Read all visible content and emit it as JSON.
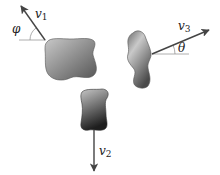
{
  "diagram": {
    "colors": {
      "background": "#ffffff",
      "fragment_light": "#bdbdbd",
      "fragment_dark": "#3a3a3a",
      "arrow": "#444444",
      "reference_line": "#9a9a9a"
    },
    "fragments": [
      {
        "id": "fragment-1",
        "velocity_label": "v",
        "velocity_subscript": "1",
        "angle_label": "φ",
        "direction": "up-left, angle φ above horizontal (left)"
      },
      {
        "id": "fragment-2",
        "velocity_label": "v",
        "velocity_subscript": "2",
        "direction": "straight down"
      },
      {
        "id": "fragment-3",
        "velocity_label": "v",
        "velocity_subscript": "3",
        "angle_label": "θ",
        "direction": "up-right, angle θ above horizontal (right)"
      }
    ]
  }
}
